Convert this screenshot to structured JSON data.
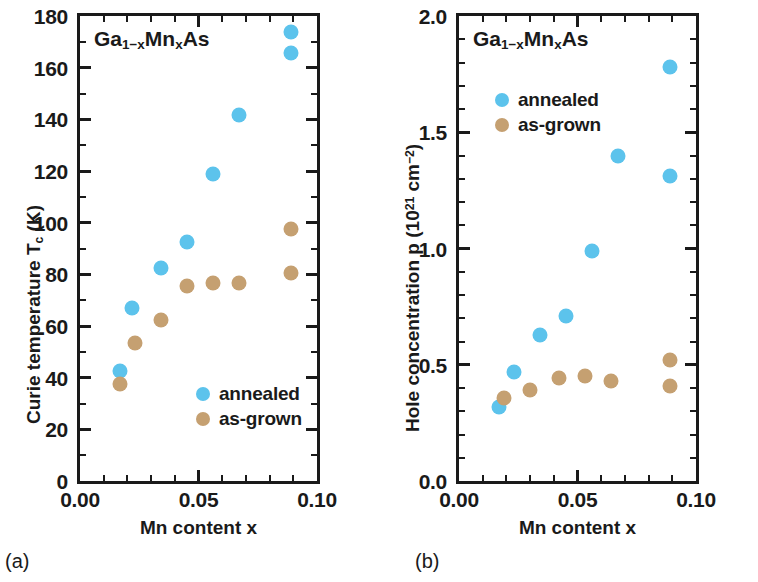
{
  "figure": {
    "panels": [
      {
        "id": "a",
        "caption": "(a)",
        "inplot_label": "Ga1-xMnxAs",
        "xlabel": "Mn content x",
        "ylabel": "Curie temperature Tc (K)"
      },
      {
        "id": "b",
        "caption": "(b)",
        "inplot_label": "Ga1-xMnxAs",
        "xlabel": "Mn content x",
        "ylabel": "Hole concentration p (1021 cm-2)"
      }
    ],
    "legend": {
      "annealed_label": "annealed",
      "asgrown_label": "as-grown",
      "annealed_color": "#5cc3ec",
      "asgrown_color": "#c5a071"
    }
  },
  "chart_data": [
    {
      "type": "scatter",
      "panel": "a",
      "title": "Ga1-xMnxAs",
      "xlabel": "Mn content x",
      "ylabel": "Curie temperature Tc (K)",
      "xlim": [
        0.0,
        0.1
      ],
      "ylim": [
        0,
        180
      ],
      "xticks": [
        0.0,
        0.05,
        0.1
      ],
      "xtick_labels": [
        "0.00",
        "0.05",
        "0.10"
      ],
      "xminor_step": 0.01,
      "yticks": [
        0,
        20,
        40,
        60,
        80,
        100,
        120,
        140,
        160,
        180
      ],
      "ytick_labels": [
        "0",
        "20",
        "40",
        "60",
        "80",
        "100",
        "120",
        "140",
        "160",
        "180"
      ],
      "yminor_step": 10,
      "grid": false,
      "legend_position": "lower right",
      "series": [
        {
          "name": "annealed",
          "color": "#5cc3ec",
          "x": [
            0.017,
            0.022,
            0.034,
            0.045,
            0.056,
            0.067,
            0.089,
            0.089
          ],
          "y": [
            42.5,
            67.0,
            82.5,
            92.5,
            119.0,
            141.5,
            174.0,
            165.5
          ]
        },
        {
          "name": "as-grown",
          "color": "#c5a071",
          "x": [
            0.017,
            0.023,
            0.034,
            0.045,
            0.056,
            0.067,
            0.089,
            0.089
          ],
          "y": [
            37.5,
            53.5,
            62.5,
            75.5,
            76.5,
            76.5,
            97.5,
            80.5
          ]
        }
      ]
    },
    {
      "type": "scatter",
      "panel": "b",
      "title": "Ga1-xMnxAs",
      "xlabel": "Mn content x",
      "ylabel": "Hole concentration p (1021 cm-2)",
      "xlim": [
        0.0,
        0.1
      ],
      "ylim": [
        0.0,
        2.0
      ],
      "xticks": [
        0.0,
        0.05,
        0.1
      ],
      "xtick_labels": [
        "0.00",
        "0.05",
        "0.10"
      ],
      "xminor_step": 0.01,
      "yticks": [
        0.0,
        0.5,
        1.0,
        1.5,
        2.0
      ],
      "ytick_labels": [
        "0.0",
        "0.5",
        "1.0",
        "1.5",
        "2.0"
      ],
      "yminor_step": 0.1,
      "grid": false,
      "legend_position": "upper left",
      "series": [
        {
          "name": "annealed",
          "color": "#5cc3ec",
          "x": [
            0.017,
            0.023,
            0.034,
            0.045,
            0.056,
            0.067,
            0.089,
            0.089
          ],
          "y": [
            0.32,
            0.47,
            0.63,
            0.71,
            0.99,
            1.4,
            1.78,
            1.31
          ]
        },
        {
          "name": "as-grown",
          "color": "#c5a071",
          "x": [
            0.019,
            0.03,
            0.042,
            0.053,
            0.064,
            0.089,
            0.089
          ],
          "y": [
            0.355,
            0.39,
            0.445,
            0.45,
            0.43,
            0.52,
            0.41
          ]
        }
      ]
    }
  ]
}
